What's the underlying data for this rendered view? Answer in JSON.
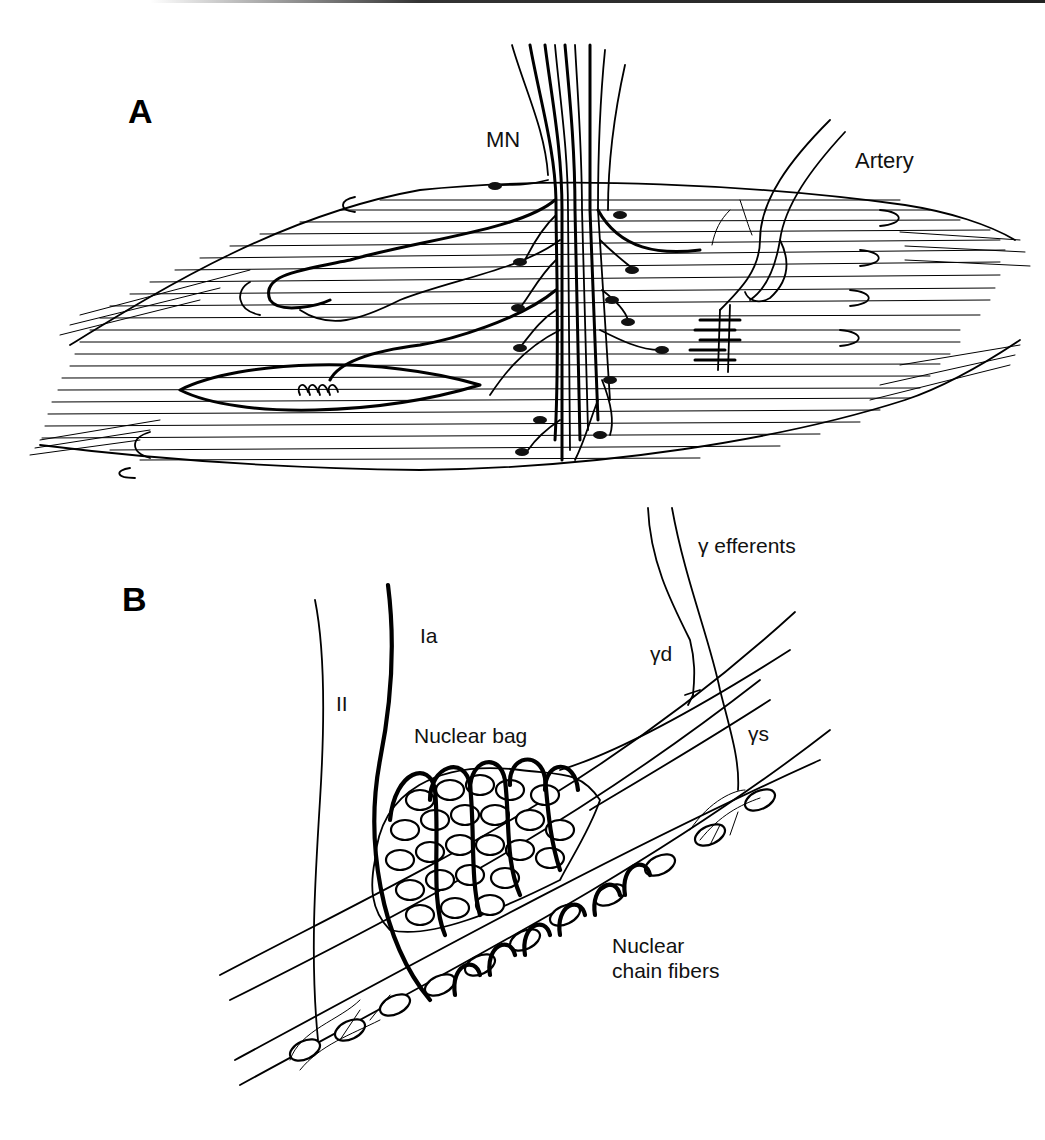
{
  "figure": {
    "panels": [
      {
        "id": "A",
        "letter": "A",
        "letter_pos": [
          128,
          123
        ],
        "title": "Skeletal muscle with motor innervation",
        "labels": [
          {
            "key": "mn",
            "text": "MN",
            "x": 486,
            "y": 147
          },
          {
            "key": "artery",
            "text": "Artery",
            "x": 855,
            "y": 168
          }
        ]
      },
      {
        "id": "B",
        "letter": "B",
        "letter_pos": [
          122,
          611
        ],
        "title": "Muscle spindle",
        "labels": [
          {
            "key": "gamma_efferents",
            "text": "γ efferents",
            "x": 698,
            "y": 553
          },
          {
            "key": "ia",
            "text": "Ia",
            "x": 420,
            "y": 643
          },
          {
            "key": "gamma_d",
            "text": "γd",
            "x": 650,
            "y": 661
          },
          {
            "key": "ii",
            "text": "II",
            "x": 336,
            "y": 711
          },
          {
            "key": "nuclear_bag",
            "text": "Nuclear bag",
            "x": 414,
            "y": 743
          },
          {
            "key": "gamma_s",
            "text": "γs",
            "x": 748,
            "y": 741
          },
          {
            "key": "nuclear_chain_1",
            "text": "Nuclear",
            "x": 612,
            "y": 953
          },
          {
            "key": "nuclear_chain_2",
            "text": "chain fibers",
            "x": 612,
            "y": 978
          }
        ]
      }
    ],
    "colors": {
      "ink": "#000000",
      "background": "#ffffff"
    }
  }
}
